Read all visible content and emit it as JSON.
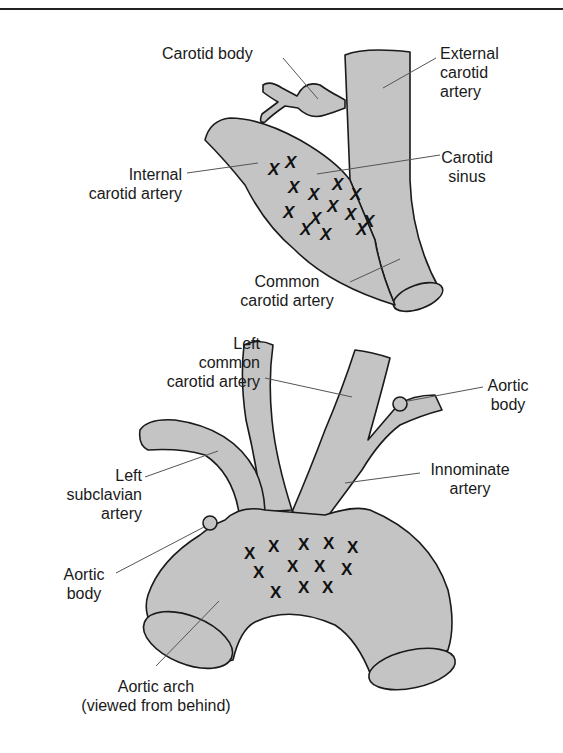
{
  "figure": {
    "top": {
      "title": "Carotid bifurcation",
      "labels": {
        "carotid_body": "Carotid body",
        "external_carotid": [
          "External",
          "carotid",
          "artery"
        ],
        "internal_carotid": [
          "Internal",
          "carotid artery"
        ],
        "carotid_sinus": [
          "Carotid",
          "sinus"
        ],
        "common_carotid": [
          "Common",
          "carotid artery"
        ]
      },
      "receptor_marker": "X",
      "receptor_count": 14
    },
    "bottom": {
      "title": "Aortic arch",
      "labels": {
        "left_common_carotid": [
          "Left",
          "common",
          "carotid artery"
        ],
        "aortic_body_right": [
          "Aortic",
          "body"
        ],
        "left_subclavian": [
          "Left",
          "subclavian",
          "artery"
        ],
        "innominate": [
          "Innominate",
          "artery"
        ],
        "aortic_body_left": [
          "Aortic",
          "body"
        ],
        "aortic_arch": [
          "Aortic arch",
          "(viewed from behind)"
        ]
      },
      "receptor_marker": "X",
      "receptor_count": 12
    },
    "colors": {
      "vessel_fill": "#c4c4c4",
      "outline": "#1a1a1a",
      "leader": "#555555"
    }
  }
}
